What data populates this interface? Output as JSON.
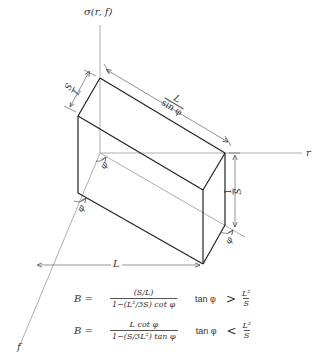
{
  "diagram": {
    "axes": {
      "vertical_label": "σ(r, f)",
      "horizontal_label": "r",
      "depth_label": "f"
    },
    "dimensions": {
      "top_edge_num": "L",
      "top_edge_den": "sin φ",
      "short_edge_num": "S",
      "short_edge_den": "L",
      "height_num": "1",
      "height_den": "S",
      "base_length": "L",
      "angle_symbol": "φ"
    },
    "formulas": [
      {
        "lhs": "B =",
        "numerator": "(S/L)",
        "denominator": "1−(L²/3S) cot φ",
        "condition_fn": "tan φ",
        "condition_op": ">",
        "condition_num": "L²",
        "condition_den": "S"
      },
      {
        "lhs": "B =",
        "numerator": "L cot φ",
        "denominator": "1−(S/3L²) tan φ",
        "condition_fn": "tan φ",
        "condition_op": "<",
        "condition_num": "L²",
        "condition_den": "S"
      }
    ]
  }
}
